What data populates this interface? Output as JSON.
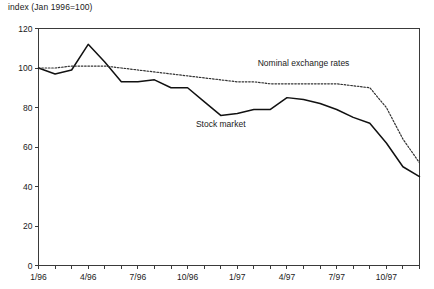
{
  "chart_data": {
    "type": "line",
    "title": "index (Jan 1996=100)",
    "xlabel": "",
    "ylabel": "",
    "ylim": [
      0,
      120
    ],
    "yticks": [
      0,
      20,
      40,
      60,
      80,
      100,
      120
    ],
    "grid": false,
    "legend_position": "inline-annotation",
    "x": [
      "1/96",
      "2/96",
      "3/96",
      "4/96",
      "5/96",
      "6/96",
      "7/96",
      "8/96",
      "9/96",
      "10/96",
      "11/96",
      "12/96",
      "1/97",
      "2/97",
      "3/97",
      "4/97",
      "5/97",
      "6/97",
      "7/97",
      "8/97",
      "9/97",
      "10/97",
      "11/97",
      "12/97"
    ],
    "xtick_labels": [
      "1/96",
      "4/96",
      "7/96",
      "10/96",
      "1/97",
      "4/97",
      "7/97",
      "10/97"
    ],
    "xtick_label_indices": [
      0,
      3,
      6,
      9,
      12,
      15,
      18,
      21
    ],
    "series": [
      {
        "name": "Stock market",
        "style": "solid",
        "label_annotation": "Stock market",
        "values": [
          100,
          97,
          99,
          112,
          103,
          93,
          93,
          94,
          90,
          90,
          83,
          76,
          77,
          79,
          79,
          85,
          84,
          82,
          79,
          75,
          72,
          62,
          50,
          45
        ]
      },
      {
        "name": "Nominal exchange rates",
        "style": "dotted",
        "label_annotation": "Nominal exchange rates",
        "values": [
          100,
          100,
          101,
          101,
          101,
          100,
          99,
          98,
          97,
          96,
          95,
          94,
          93,
          93,
          92,
          92,
          92,
          92,
          92,
          91,
          90,
          80,
          64,
          52
        ]
      }
    ],
    "annotations": [
      {
        "text": "Nominal exchange rates",
        "x_index": 16,
        "y_value": 101
      },
      {
        "text": "Stock market",
        "x_index": 11,
        "y_value": 70
      }
    ]
  }
}
